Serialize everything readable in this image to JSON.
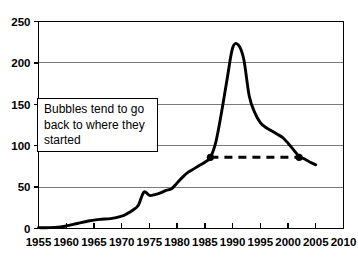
{
  "chart_data": {
    "type": "line",
    "title": "",
    "xlabel": "",
    "ylabel": "",
    "xlim": [
      1955,
      2010
    ],
    "ylim": [
      0,
      250
    ],
    "grid": true,
    "legend": null,
    "x_ticks": [
      1955,
      1960,
      1965,
      1970,
      1975,
      1980,
      1985,
      1990,
      1995,
      2000,
      2005,
      2010
    ],
    "y_ticks": [
      0,
      50,
      100,
      150,
      200,
      250
    ],
    "series": [
      {
        "name": "index",
        "color": "#000000",
        "x": [
          1955,
          1957,
          1959,
          1960,
          1962,
          1964,
          1966,
          1968,
          1970,
          1971,
          1972,
          1973,
          1974,
          1975,
          1976,
          1977,
          1978,
          1979,
          1980,
          1981,
          1982,
          1983,
          1984,
          1985,
          1986,
          1987,
          1988,
          1989,
          1990,
          1991,
          1992,
          1993,
          1994,
          1995,
          1996,
          1997,
          1998,
          1999,
          2000,
          2001,
          2002,
          2003,
          2004,
          2005
        ],
        "values": [
          1,
          1,
          2,
          3,
          6,
          9,
          11,
          12,
          15,
          18,
          22,
          28,
          44,
          40,
          41,
          43,
          46,
          48,
          55,
          62,
          68,
          72,
          76,
          80,
          86,
          105,
          140,
          180,
          218,
          222,
          205,
          160,
          140,
          128,
          122,
          118,
          114,
          110,
          103,
          95,
          87,
          84,
          80,
          77
        ]
      }
    ],
    "annotations": [
      {
        "name": "callout",
        "text": "Bubbles tend to go\nback to where they\nstarted"
      }
    ],
    "reference_line": {
      "name": "bubble-return-line",
      "style": "dashed",
      "color": "#000000",
      "value": 86,
      "x_start": 1986,
      "x_end": 2002,
      "markers": [
        {
          "x": 1986,
          "y": 86
        },
        {
          "x": 2002,
          "y": 86
        }
      ]
    }
  }
}
